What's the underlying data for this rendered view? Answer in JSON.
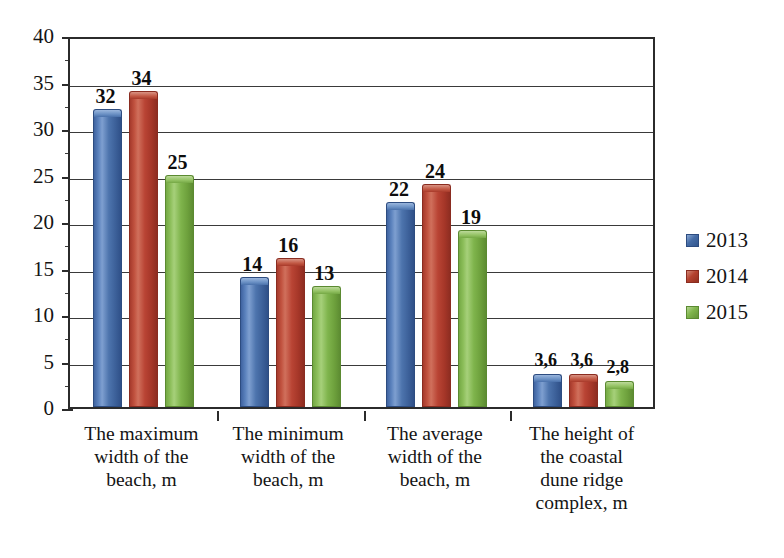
{
  "chart_data": {
    "type": "bar",
    "title": "",
    "xlabel": "",
    "ylabel": "",
    "ylim": [
      0,
      40
    ],
    "ytick_step": 5,
    "yticks": [
      "0",
      "5",
      "10",
      "15",
      "20",
      "25",
      "30",
      "35",
      "40"
    ],
    "grid": true,
    "legend_position": "right",
    "decimal_separator": ",",
    "categories": [
      "The maximum width of the beach, m",
      "The minimum width of the beach, m",
      "The average width of the beach, m",
      "The height of the coastal dune ridge complex, m"
    ],
    "category_lines": [
      [
        "The maximum",
        "width of the",
        "beach, m"
      ],
      [
        "The minimum",
        "width of the",
        "beach, m"
      ],
      [
        "The average",
        "width of the",
        "beach, m"
      ],
      [
        "The height of",
        "the coastal",
        "dune ridge",
        "complex, m"
      ]
    ],
    "series": [
      {
        "name": "2013",
        "color": "#456ca6",
        "values": [
          32,
          14,
          22,
          3.6
        ],
        "labels": [
          "32",
          "14",
          "22",
          "3,6"
        ]
      },
      {
        "name": "2014",
        "color": "#b5422f",
        "values": [
          34,
          16,
          24,
          3.6
        ],
        "labels": [
          "34",
          "16",
          "24",
          "3,6"
        ]
      },
      {
        "name": "2015",
        "color": "#80b54c",
        "values": [
          25,
          13,
          19,
          2.8
        ],
        "labels": [
          "25",
          "13",
          "19",
          "2,8"
        ]
      }
    ]
  },
  "legend": {
    "items": [
      {
        "label": "2013",
        "key": "s2013"
      },
      {
        "label": "2014",
        "key": "s2014"
      },
      {
        "label": "2015",
        "key": "s2015"
      }
    ]
  }
}
